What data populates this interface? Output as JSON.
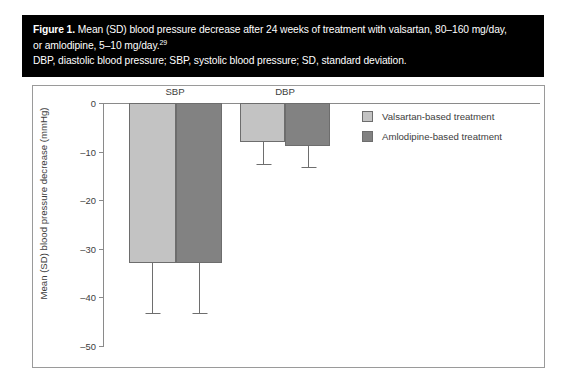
{
  "caption": {
    "figure_label": "Figure 1.",
    "line1_rest": " Mean (SD) blood pressure decrease after 24 weeks of treatment with valsartan, 80–160 mg/day,",
    "line2": "or amlodipine, 5–10 mg/day.",
    "line2_superscript": "29",
    "line3": "DBP, diastolic blood pressure; SBP, systolic blood pressure; SD, standard deviation."
  },
  "legend": {
    "items": [
      {
        "label": "Valsartan-based treatment",
        "color": "#c3c3c3"
      },
      {
        "label": "Amlodipine-based treatment",
        "color": "#828282"
      }
    ]
  },
  "chart_data": {
    "type": "bar",
    "title": "",
    "xlabel": "",
    "ylabel": "Mean (SD) blood pressure decrease (mmHg)",
    "categories": [
      "SBP",
      "DBP"
    ],
    "ylim": [
      -50,
      0
    ],
    "yticks": [
      0,
      -10,
      -20,
      -30,
      -40,
      -50
    ],
    "ytick_labels": [
      "0",
      "–10",
      "–20",
      "–30",
      "–40",
      "–50"
    ],
    "grid": false,
    "legend_position": "right",
    "units": "mmHg",
    "series": [
      {
        "name": "Valsartan-based treatment",
        "color": "#c3c3c3",
        "values": [
          -33.0,
          -8.0
        ],
        "errors": [
          10.2,
          4.6
        ],
        "error_low": [
          -43.2,
          -12.6
        ]
      },
      {
        "name": "Amlodipine-based treatment",
        "color": "#828282",
        "values": [
          -33.0,
          -8.8
        ],
        "errors": [
          10.2,
          4.4
        ],
        "error_low": [
          -43.2,
          -13.2
        ]
      }
    ]
  }
}
